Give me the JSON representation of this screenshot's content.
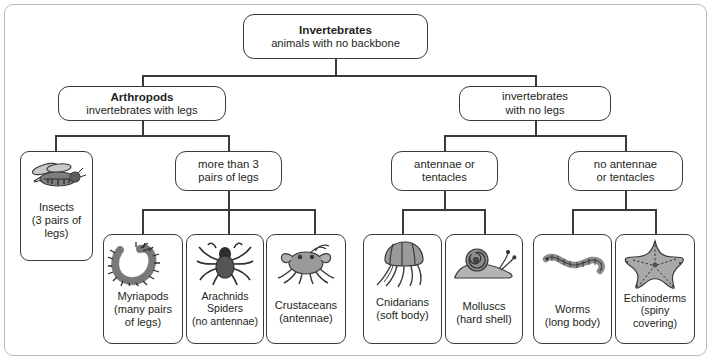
{
  "diagram": {
    "root": {
      "line1": "Invertebrates",
      "line2": "animals with no backbone"
    },
    "level2": [
      {
        "line1": "Arthropods",
        "line2": "invertebrates with legs"
      },
      {
        "line1": "invertebrates",
        "line2": "with no legs"
      }
    ],
    "level3": [
      {
        "line1": "more than 3",
        "line2": "pairs of legs"
      },
      {
        "line1": "antennae or",
        "line2": "tentacles"
      },
      {
        "line1": "no antennae",
        "line2": "or tentacles"
      }
    ],
    "leaves": [
      {
        "icon": "bee-icon",
        "lines": [
          "Insects",
          "(3 pairs of",
          "legs)"
        ]
      },
      {
        "icon": "millipede-icon",
        "lines": [
          "Myriapods",
          "(many pairs",
          "of legs)"
        ]
      },
      {
        "icon": "spider-icon",
        "lines": [
          "Arachnids",
          "Spiders",
          "(no antennae)"
        ]
      },
      {
        "icon": "crab-icon",
        "lines": [
          "Crustaceans",
          "(antennae)"
        ]
      },
      {
        "icon": "jellyfish-icon",
        "lines": [
          "Cnidarians",
          "(soft body)"
        ]
      },
      {
        "icon": "snail-icon",
        "lines": [
          "Molluscs",
          "(hard shell)"
        ]
      },
      {
        "icon": "worm-icon",
        "lines": [
          "Worms",
          "(long body)"
        ]
      },
      {
        "icon": "starfish-icon",
        "lines": [
          "Echinoderms",
          "(spiny",
          "covering)"
        ]
      }
    ],
    "colors": {
      "frame": "#b9b9b9",
      "box_border": "#3a3a3a",
      "text": "#231f20",
      "art_fill": "#9a9a9a",
      "art_stroke": "#3b3b3b"
    }
  }
}
